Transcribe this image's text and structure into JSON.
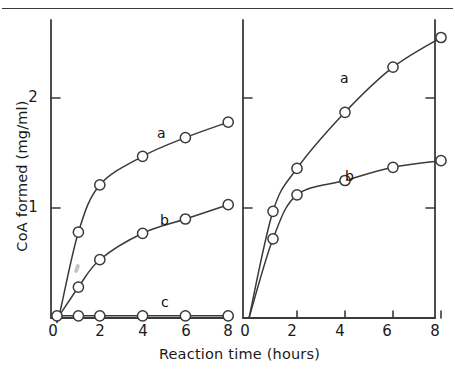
{
  "figure": {
    "x_axis_title": "Reaction time (hours)",
    "y_axis_title": "CoA formed (mg/ml)",
    "line_color": "#3a3a3a",
    "marker_fill": "#ffffff"
  },
  "left_panel": {
    "x_ticks": [
      "0",
      "2",
      "4",
      "6",
      "8"
    ],
    "y_ticks": [
      "1",
      "2"
    ],
    "curve_labels": {
      "a": "a",
      "b": "b",
      "c": "c"
    }
  },
  "right_panel": {
    "x_ticks": [
      "0",
      "2",
      "4",
      "6",
      "8"
    ],
    "curve_labels": {
      "a": "a",
      "b": "b"
    }
  },
  "chart_data": {
    "type": "line",
    "title": "",
    "xlabel": "Reaction time (hours)",
    "ylabel": "CoA formed (mg/ml)",
    "xlim": [
      0,
      8.6
    ],
    "ylim": [
      0,
      2.72
    ],
    "grid": false,
    "legend": "inline-curve-labels",
    "panels": [
      {
        "name": "left-panel",
        "x_ticks": [
          0,
          2,
          4,
          6,
          8
        ],
        "y_ticks": [
          1,
          2
        ],
        "series": [
          {
            "name": "a",
            "x": [
              0,
              0.1,
              1,
              2,
              4,
              6,
              8
            ],
            "values": [
              0,
              0.02,
              0.78,
              1.21,
              1.47,
              1.64,
              1.78
            ]
          },
          {
            "name": "b",
            "x": [
              0,
              0.1,
              1,
              2,
              4,
              6,
              8
            ],
            "values": [
              0,
              0.02,
              0.28,
              0.53,
              0.77,
              0.9,
              1.03
            ]
          },
          {
            "name": "c",
            "x": [
              0,
              1,
              2,
              4,
              6,
              8
            ],
            "values": [
              0.02,
              0.02,
              0.02,
              0.02,
              0.02,
              0.02
            ]
          }
        ]
      },
      {
        "name": "right-panel",
        "x_ticks": [
          0,
          2,
          4,
          6,
          8
        ],
        "y_ticks": [
          1,
          2
        ],
        "series": [
          {
            "name": "a",
            "x": [
              0,
              1,
              2,
              4,
              6,
              8
            ],
            "values": [
              0,
              0.97,
              1.36,
              1.87,
              2.28,
              2.55
            ]
          },
          {
            "name": "b",
            "x": [
              0,
              1,
              2,
              4,
              6,
              8
            ],
            "values": [
              0,
              0.72,
              1.12,
              1.25,
              1.37,
              1.43
            ]
          }
        ]
      }
    ]
  }
}
